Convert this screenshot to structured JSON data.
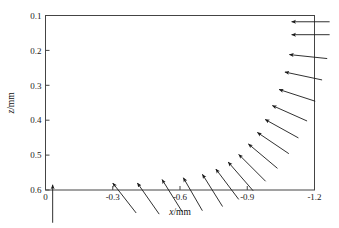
{
  "chart_data": {
    "type": "scatter",
    "subtype": "quiver-vector-field",
    "title": "",
    "xlabel": "x/mm",
    "ylabel": "z/mm",
    "xlim": [
      0,
      -1.2
    ],
    "ylim": [
      0.6,
      0.1
    ],
    "x_ticks": [
      "0",
      "-0.3",
      "-0.6",
      "-0.9",
      "-1.2"
    ],
    "x_tick_values": [
      0,
      -0.3,
      -0.6,
      -0.9,
      -1.2
    ],
    "y_ticks": [
      "0.1",
      "0.2",
      "0.3",
      "0.4",
      "0.5",
      "0.6"
    ],
    "y_tick_values": [
      0.1,
      0.2,
      0.3,
      0.4,
      0.5,
      0.6
    ],
    "x_axis_inverted": true,
    "y_axis_inverted": true,
    "grid": false,
    "legend": "none",
    "frame": "box",
    "arrow_color": "#1a1a1a",
    "vectors": [
      {
        "x": -0.032,
        "z": 0.585,
        "u": 0.0,
        "v": -0.102,
        "angle_deg": 90
      },
      {
        "x": -0.3,
        "z": 0.58,
        "u": -0.065,
        "v": -0.082,
        "angle_deg": 52
      },
      {
        "x": -0.41,
        "z": 0.58,
        "u": -0.06,
        "v": -0.085,
        "angle_deg": 55
      },
      {
        "x": -0.52,
        "z": 0.57,
        "u": -0.058,
        "v": -0.092,
        "angle_deg": 58
      },
      {
        "x": -0.615,
        "z": 0.565,
        "u": -0.055,
        "v": -0.095,
        "angle_deg": 60
      },
      {
        "x": -0.7,
        "z": 0.555,
        "u": -0.062,
        "v": -0.098,
        "angle_deg": 58
      },
      {
        "x": -0.76,
        "z": 0.54,
        "u": -0.075,
        "v": -0.098,
        "angle_deg": 53
      },
      {
        "x": -0.815,
        "z": 0.52,
        "u": -0.082,
        "v": -0.095,
        "angle_deg": 49
      },
      {
        "x": -0.862,
        "z": 0.498,
        "u": -0.09,
        "v": -0.09,
        "angle_deg": 45
      },
      {
        "x": -0.905,
        "z": 0.468,
        "u": -0.098,
        "v": -0.082,
        "angle_deg": 40
      },
      {
        "x": -0.945,
        "z": 0.435,
        "u": -0.105,
        "v": -0.072,
        "angle_deg": 34
      },
      {
        "x": -0.98,
        "z": 0.398,
        "u": -0.11,
        "v": -0.062,
        "angle_deg": 29
      },
      {
        "x": -1.012,
        "z": 0.358,
        "u": -0.115,
        "v": -0.05,
        "angle_deg": 24
      },
      {
        "x": -1.042,
        "z": 0.312,
        "u": -0.118,
        "v": -0.038,
        "angle_deg": 18
      },
      {
        "x": -1.068,
        "z": 0.262,
        "u": -0.12,
        "v": -0.026,
        "angle_deg": 12
      },
      {
        "x": -1.088,
        "z": 0.212,
        "u": -0.122,
        "v": -0.014,
        "angle_deg": 6
      },
      {
        "x": -1.098,
        "z": 0.155,
        "u": -0.125,
        "v": 0.0,
        "angle_deg": 0
      },
      {
        "x": -1.098,
        "z": 0.118,
        "u": -0.125,
        "v": 0.0,
        "angle_deg": 0
      }
    ]
  },
  "axes": {
    "x_title": "x/mm",
    "y_title": "z/mm"
  }
}
